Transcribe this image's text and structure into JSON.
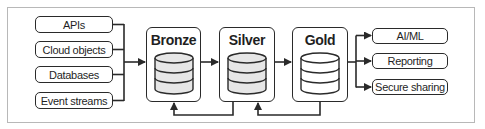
{
  "diagram": {
    "sources": [
      {
        "label": "APIs"
      },
      {
        "label": "Cloud objects"
      },
      {
        "label": "Databases"
      },
      {
        "label": "Event streams"
      }
    ],
    "stages": [
      {
        "label": "Bronze",
        "fill": "#e6e6e6"
      },
      {
        "label": "Silver",
        "fill": "#e6e6e6"
      },
      {
        "label": "Gold",
        "fill": "#ffffff"
      }
    ],
    "outputs": [
      {
        "label": "AI/ML"
      },
      {
        "label": "Reporting"
      },
      {
        "label": "Secure sharing"
      }
    ],
    "colors": {
      "stroke": "#2a2a2a",
      "frame": "#b8b8b8",
      "cylinder_shaded": "#e6e6e6",
      "cylinder_plain": "#ffffff"
    }
  }
}
